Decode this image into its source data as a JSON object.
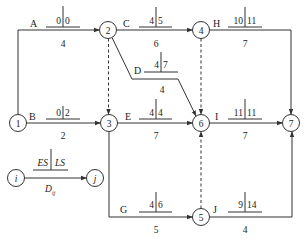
{
  "diagram": {
    "type": "activity-on-arrow network",
    "colors": {
      "line": "#333333",
      "background": "#ffffff"
    },
    "nodes": [
      {
        "id": "1",
        "label": "1",
        "x": 18,
        "y": 123
      },
      {
        "id": "2",
        "label": "2",
        "x": 108,
        "y": 30
      },
      {
        "id": "3",
        "label": "3",
        "x": 109,
        "y": 123
      },
      {
        "id": "4",
        "label": "4",
        "x": 201,
        "y": 30
      },
      {
        "id": "5",
        "label": "5",
        "x": 201,
        "y": 217
      },
      {
        "id": "6",
        "label": "6",
        "x": 201,
        "y": 123
      },
      {
        "id": "7",
        "label": "7",
        "x": 291,
        "y": 123
      }
    ],
    "activities": [
      {
        "name": "A",
        "from": "1",
        "to": "2",
        "es": "0",
        "ls": "0",
        "duration": "4"
      },
      {
        "name": "B",
        "from": "1",
        "to": "3",
        "es": "0",
        "ls": "2",
        "duration": "2"
      },
      {
        "name": "C",
        "from": "2",
        "to": "4",
        "es": "4",
        "ls": "5",
        "duration": "6"
      },
      {
        "name": "D",
        "from": "2",
        "to": "6",
        "es": "4",
        "ls": "7",
        "duration": "4"
      },
      {
        "name": "E",
        "from": "3",
        "to": "6",
        "es": "4",
        "ls": "4",
        "duration": "7"
      },
      {
        "name": "G",
        "from": "3",
        "to": "5",
        "es": "4",
        "ls": "6",
        "duration": "5"
      },
      {
        "name": "H",
        "from": "4",
        "to": "7",
        "es": "10",
        "ls": "11",
        "duration": "7"
      },
      {
        "name": "I",
        "from": "6",
        "to": "7",
        "es": "11",
        "ls": "11",
        "duration": "7"
      },
      {
        "name": "J",
        "from": "5",
        "to": "7",
        "es": "9",
        "ls": "14",
        "duration": "4"
      }
    ],
    "dummies": [
      {
        "from": "2",
        "to": "3"
      },
      {
        "from": "4",
        "to": "6"
      },
      {
        "from": "5",
        "to": "6"
      }
    ],
    "legend": {
      "from_node": "i",
      "to_node": "j",
      "es_label": "ES",
      "ls_label": "LS",
      "duration_label": "D",
      "duration_subscript": "ij"
    }
  }
}
